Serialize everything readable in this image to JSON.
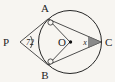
{
  "figure": {
    "type": "circle-geometry-diagram",
    "background_color": "#f7f5f1",
    "ink_color": "#262626",
    "width": 115,
    "height": 82,
    "circle": {
      "center_label": "O",
      "center_x": 70,
      "center_y": 42,
      "radius": 31.5
    },
    "points": [
      {
        "id": "A",
        "label": "A",
        "x": 48,
        "y": 19,
        "label_x": 45,
        "label_y": 12,
        "marker": "open-circle"
      },
      {
        "id": "B",
        "label": "B",
        "x": 48,
        "y": 65,
        "label_x": 45,
        "label_y": 79,
        "marker": "open-circle"
      },
      {
        "id": "C",
        "label": "C",
        "x": 101,
        "y": 42,
        "label_x": 105,
        "label_y": 46,
        "marker": "none"
      },
      {
        "id": "O",
        "label": "O",
        "x": 70,
        "y": 42,
        "label_x": 62,
        "label_y": 46,
        "marker": "dot"
      },
      {
        "id": "P",
        "label": "P",
        "x": 20,
        "y": 42,
        "label_x": 3,
        "label_y": 46,
        "marker": "none"
      }
    ],
    "segments": [
      {
        "name": "P-to-A",
        "from": "P",
        "to": "A"
      },
      {
        "name": "P-to-B",
        "from": "P",
        "to": "B"
      },
      {
        "name": "A-to-O",
        "from": "A",
        "to": "O"
      },
      {
        "name": "B-to-O",
        "from": "B",
        "to": "O"
      },
      {
        "name": "A-to-C",
        "from": "A",
        "to": "C"
      },
      {
        "name": "B-to-C",
        "from": "B",
        "to": "C"
      }
    ],
    "angles": [
      {
        "name": "angle-at-P",
        "vertex": "P",
        "value_label": "72",
        "label_x": 26,
        "label_y": 45,
        "marker": "arc",
        "shaded": false
      },
      {
        "name": "angle-at-C",
        "vertex": "C",
        "value_label": "x",
        "label_x": 85,
        "label_y": 45,
        "marker": "filled-wedge",
        "shaded": true,
        "shade_color": "#8a8a8a"
      }
    ]
  }
}
